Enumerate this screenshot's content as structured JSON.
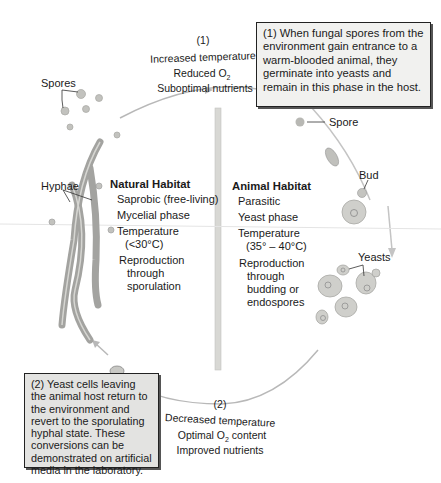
{
  "box1": {
    "text": "(1) When fungal spores from the environment gain entrance to a warm-blooded animal, they germinate into yeasts and remain in this phase in the host."
  },
  "box2": {
    "text": "(2) Yeast cells leaving the animal host return to the environment and revert to the sporulating hyphal state. These conversions can be demonstrated on artificial media in the laboratory."
  },
  "top_conditions": {
    "number": "(1)",
    "line1": "Increased temperature",
    "line2_main": "Reduced O",
    "line2_sub": "2",
    "line3": "Suboptimal nutrients"
  },
  "bottom_conditions": {
    "number": "(2)",
    "line1": "Decreased temperature",
    "line2_main": "Optimal O",
    "line2_sub": "2",
    "line2_end": " content",
    "line3": "Improved nutrients"
  },
  "labels": {
    "spores": "Spores",
    "spore": "Spore",
    "hyphae": "Hyphae",
    "bud": "Bud",
    "yeasts": "Yeasts"
  },
  "natural_habitat": {
    "title": "Natural Habitat",
    "items": [
      "Saprobic (free-living)",
      "Mycelial phase",
      "Temperature",
      "(<30°C)",
      "Reproduction",
      "through",
      "sporulation"
    ]
  },
  "animal_habitat": {
    "title": "Animal Habitat",
    "items": [
      "Parasitic",
      "Yeast phase",
      "Temperature",
      "(35° – 40°C)",
      "Reproduction",
      "through",
      "budding or",
      "endospores"
    ]
  },
  "colors": {
    "cycle_arrow": "#b8b8b8",
    "hyphae": "#a3a3a0",
    "yeast_cell": "#c8c8c4",
    "box_fill": "#f1f1ef",
    "box2_fill": "#e3e3e1"
  }
}
